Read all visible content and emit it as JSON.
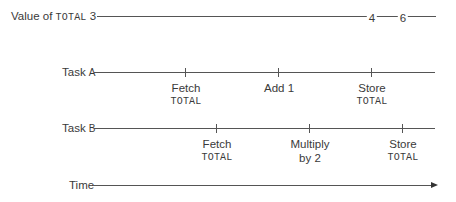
{
  "rows": {
    "total": {
      "label_prefix": "Value of ",
      "label_var": "TOTAL",
      "label_value": "3",
      "values": [
        {
          "text": "4",
          "x": 372
        },
        {
          "text": "6",
          "x": 403
        }
      ]
    },
    "task_a": {
      "label_word": "Task ",
      "label_letter": "A",
      "events": [
        {
          "line1": "Fetch",
          "line2": "TOTAL",
          "x": 185
        },
        {
          "line1": "Add 1",
          "line2": "",
          "x": 278
        },
        {
          "line1": "Store",
          "line2": "TOTAL",
          "x": 371
        }
      ]
    },
    "task_b": {
      "label_word": "Task ",
      "label_letter": "B",
      "events": [
        {
          "line1": "Fetch",
          "line2": "TOTAL",
          "x": 216
        },
        {
          "line1": "Multiply",
          "line2": "by 2",
          "x": 309
        },
        {
          "line1": "Store",
          "line2": "TOTAL",
          "x": 402
        }
      ]
    },
    "time": {
      "label": "Time"
    }
  }
}
